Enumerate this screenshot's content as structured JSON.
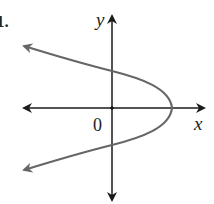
{
  "problem_label": "1.",
  "axes": {
    "x_label": "x",
    "y_label": "y",
    "origin_label": "0",
    "axis_color": "#1a1a1a"
  },
  "curve": {
    "type": "parabola opening left",
    "color": "#666666",
    "vertex_px": [
      172,
      108
    ],
    "y_intercepts_px": [
      [
        112,
        72
      ],
      [
        112,
        145
      ]
    ]
  }
}
